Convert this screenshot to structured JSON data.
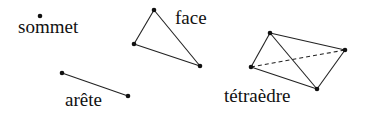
{
  "figure": {
    "width": 365,
    "height": 115,
    "background": "#ffffff",
    "ink_color": "#111111"
  },
  "items": {
    "sommet": {
      "label": "sommet",
      "points": [
        [
          40,
          16
        ]
      ]
    },
    "face": {
      "label": "face",
      "points": [
        [
          154,
          10
        ],
        [
          134,
          44
        ],
        [
          200,
          66
        ]
      ],
      "edges": [
        [
          0,
          1
        ],
        [
          1,
          2
        ],
        [
          2,
          0
        ]
      ]
    },
    "arete": {
      "label": "arête",
      "points": [
        [
          62,
          73
        ],
        [
          128,
          96
        ]
      ],
      "edges": [
        [
          0,
          1
        ]
      ]
    },
    "tetraedre": {
      "label": "tétraèdre",
      "points": [
        [
          270,
          33
        ],
        [
          345,
          50
        ],
        [
          251,
          67
        ],
        [
          317,
          89
        ]
      ],
      "solid_edges": [
        [
          0,
          1
        ],
        [
          0,
          2
        ],
        [
          0,
          3
        ],
        [
          1,
          3
        ],
        [
          2,
          3
        ]
      ],
      "hidden_edges": [
        [
          2,
          1
        ]
      ]
    }
  }
}
